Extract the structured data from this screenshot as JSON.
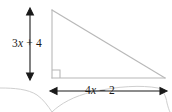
{
  "figure": {
    "shape": "right triangle",
    "stroke_color": "#b8b8b8",
    "arrow_color": "#1a1a1a",
    "text_color": "#1a1a1a",
    "background": "#ffffff",
    "artifact_color": "#cfcfcf"
  },
  "labels": {
    "height": {
      "full": "3x + 4",
      "coefficient": "3",
      "variable": "x",
      "operator": "+",
      "constant": "4",
      "measures": "vertical leg"
    },
    "base": {
      "full": "4x − 2",
      "coefficient": "4",
      "variable": "x",
      "operator": "−",
      "constant": "2",
      "measures": "horizontal leg"
    }
  },
  "geometry": {
    "apex": "52,10",
    "bottom_left": "52,78",
    "bottom_right": "165,78",
    "right_angle_vertex": "bottom-left",
    "vertical_arrow": "30,10 to 30,78",
    "horizontal_arrow": "52,91 to 165,91"
  }
}
